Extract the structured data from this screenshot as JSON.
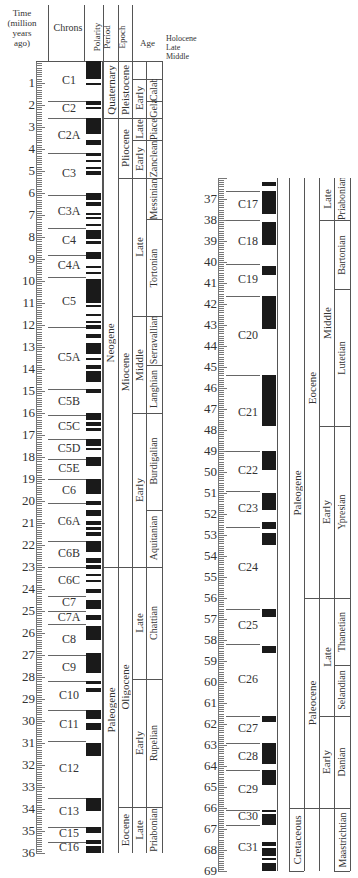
{
  "chart_data": {
    "type": "table",
    "headers": [
      "Time (million years ago)",
      "Chrons",
      "Polarity",
      "Period",
      "Epoch",
      "Age"
    ],
    "age_labels_top": [
      "Holocene",
      "Late",
      "Middle",
      "Calabrian",
      "Gelasian",
      "Piacenzian"
    ],
    "left_axis": {
      "range": [
        0,
        36
      ],
      "ticks": [
        1,
        2,
        3,
        4,
        5,
        6,
        7,
        8,
        9,
        10,
        11,
        12,
        13,
        14,
        15,
        16,
        17,
        18,
        19,
        20,
        21,
        22,
        23,
        24,
        25,
        26,
        27,
        28,
        29,
        30,
        31,
        32,
        33,
        34,
        35,
        36
      ]
    },
    "right_axis": {
      "range": [
        36,
        69
      ],
      "ticks": [
        37,
        38,
        39,
        40,
        41,
        42,
        43,
        44,
        45,
        46,
        47,
        48,
        49,
        50,
        51,
        52,
        53,
        54,
        55,
        56,
        57,
        58,
        59,
        60,
        61,
        62,
        63,
        64,
        65,
        66,
        67,
        68,
        69
      ]
    },
    "chrons": [
      {
        "name": "C1",
        "start": 0,
        "end": 1.8
      },
      {
        "name": "C2",
        "start": 1.8,
        "end": 2.6
      },
      {
        "name": "C2A",
        "start": 2.6,
        "end": 4.2
      },
      {
        "name": "C3",
        "start": 4.2,
        "end": 6.1
      },
      {
        "name": "C3A",
        "start": 6.1,
        "end": 7.6
      },
      {
        "name": "C4",
        "start": 7.6,
        "end": 8.8
      },
      {
        "name": "C4A",
        "start": 8.8,
        "end": 9.8
      },
      {
        "name": "C5",
        "start": 9.8,
        "end": 12.1
      },
      {
        "name": "C5A",
        "start": 12.1,
        "end": 14.9
      },
      {
        "name": "C5B",
        "start": 14.9,
        "end": 16.1
      },
      {
        "name": "C5C",
        "start": 16.1,
        "end": 17.2
      },
      {
        "name": "C5D",
        "start": 17.2,
        "end": 18.1
      },
      {
        "name": "C5E",
        "start": 18.1,
        "end": 19.0
      },
      {
        "name": "C6",
        "start": 19.0,
        "end": 20.1
      },
      {
        "name": "C6A",
        "start": 20.1,
        "end": 21.8
      },
      {
        "name": "C6B",
        "start": 21.8,
        "end": 23.0
      },
      {
        "name": "C6C",
        "start": 23.0,
        "end": 24.3
      },
      {
        "name": "C7",
        "start": 24.3,
        "end": 25.0
      },
      {
        "name": "C7A",
        "start": 25.0,
        "end": 25.6
      },
      {
        "name": "C8",
        "start": 25.6,
        "end": 27.0
      },
      {
        "name": "C9",
        "start": 27.0,
        "end": 28.2
      },
      {
        "name": "C10",
        "start": 28.2,
        "end": 29.5
      },
      {
        "name": "C11",
        "start": 29.5,
        "end": 30.9
      },
      {
        "name": "C12",
        "start": 30.9,
        "end": 33.5
      },
      {
        "name": "C13",
        "start": 33.5,
        "end": 34.8
      },
      {
        "name": "C15",
        "start": 34.8,
        "end": 35.5
      },
      {
        "name": "C16",
        "start": 35.5,
        "end": 36.6
      },
      {
        "name": "C17",
        "start": 36.6,
        "end": 38.0
      },
      {
        "name": "C18",
        "start": 38.0,
        "end": 40.1
      },
      {
        "name": "C19",
        "start": 40.1,
        "end": 41.6
      },
      {
        "name": "C20",
        "start": 41.6,
        "end": 45.4
      },
      {
        "name": "C21",
        "start": 45.4,
        "end": 49.0
      },
      {
        "name": "C22",
        "start": 49.0,
        "end": 50.9
      },
      {
        "name": "C23",
        "start": 50.9,
        "end": 52.6
      },
      {
        "name": "C24",
        "start": 52.6,
        "end": 56.5
      },
      {
        "name": "C25",
        "start": 56.5,
        "end": 58.2
      },
      {
        "name": "C26",
        "start": 58.2,
        "end": 61.6
      },
      {
        "name": "C27",
        "start": 61.6,
        "end": 62.9
      },
      {
        "name": "C28",
        "start": 62.9,
        "end": 64.2
      },
      {
        "name": "C29",
        "start": 64.2,
        "end": 66.1
      },
      {
        "name": "C30",
        "start": 66.1,
        "end": 66.8
      },
      {
        "name": "C31",
        "start": 66.8,
        "end": 69.0
      }
    ],
    "normal_polarity_intervals": [
      [
        0.0,
        0.8
      ],
      [
        1.0,
        1.1
      ],
      [
        1.8,
        2.0
      ],
      [
        2.1,
        2.2
      ],
      [
        2.6,
        3.3
      ],
      [
        3.6,
        3.8
      ],
      [
        4.2,
        4.3
      ],
      [
        4.5,
        4.6
      ],
      [
        4.8,
        4.9
      ],
      [
        5.0,
        5.2
      ],
      [
        6.0,
        6.3
      ],
      [
        6.4,
        6.6
      ],
      [
        6.9,
        7.0
      ],
      [
        7.1,
        7.2
      ],
      [
        7.4,
        7.5
      ],
      [
        7.7,
        8.1
      ],
      [
        8.2,
        8.3
      ],
      [
        8.7,
        9.0
      ],
      [
        9.3,
        9.4
      ],
      [
        9.6,
        9.7
      ],
      [
        9.9,
        11.0
      ],
      [
        11.1,
        11.2
      ],
      [
        11.5,
        11.6
      ],
      [
        11.8,
        11.9
      ],
      [
        12.0,
        12.2
      ],
      [
        12.4,
        12.6
      ],
      [
        12.8,
        13.3
      ],
      [
        13.5,
        13.6
      ],
      [
        13.8,
        14.0
      ],
      [
        14.1,
        14.6
      ],
      [
        14.9,
        15.1
      ],
      [
        16.0,
        16.3
      ],
      [
        16.4,
        16.6
      ],
      [
        16.7,
        16.8
      ],
      [
        17.2,
        17.5
      ],
      [
        17.6,
        17.7
      ],
      [
        18.0,
        18.4
      ],
      [
        19.0,
        19.7
      ],
      [
        20.0,
        20.2
      ],
      [
        20.4,
        20.7
      ],
      [
        20.9,
        21.1
      ],
      [
        21.2,
        21.3
      ],
      [
        21.4,
        21.6
      ],
      [
        21.8,
        22.3
      ],
      [
        22.6,
        22.8
      ],
      [
        22.9,
        23.1
      ],
      [
        23.3,
        23.4
      ],
      [
        23.6,
        23.7
      ],
      [
        24.0,
        24.2
      ],
      [
        24.5,
        24.9
      ],
      [
        25.2,
        25.4
      ],
      [
        25.7,
        26.3
      ],
      [
        26.9,
        27.8
      ],
      [
        28.2,
        28.3
      ],
      [
        28.5,
        28.7
      ],
      [
        29.5,
        29.9
      ],
      [
        30.1,
        30.4
      ],
      [
        31.0,
        31.6
      ],
      [
        33.5,
        34.1
      ],
      [
        34.8,
        35.1
      ],
      [
        35.4,
        35.6
      ],
      [
        35.7,
        36.0
      ],
      [
        36.2,
        36.4
      ],
      [
        36.6,
        37.7
      ],
      [
        38.1,
        39.2
      ],
      [
        40.2,
        40.6
      ],
      [
        41.6,
        43.2
      ],
      [
        45.4,
        47.8
      ],
      [
        49.0,
        49.9
      ],
      [
        51.0,
        51.8
      ],
      [
        52.4,
        52.7
      ],
      [
        52.9,
        53.5
      ],
      [
        56.5,
        56.9
      ],
      [
        58.3,
        58.6
      ],
      [
        61.6,
        61.9
      ],
      [
        62.9,
        63.9
      ],
      [
        64.2,
        64.9
      ],
      [
        66.1,
        66.2
      ],
      [
        66.3,
        66.8
      ],
      [
        67.6,
        67.8
      ],
      [
        67.9,
        68.3
      ],
      [
        68.4,
        68.5
      ],
      [
        68.6,
        69.0
      ]
    ],
    "periods": [
      {
        "name": "Quaternary",
        "start": 0,
        "end": 2.6
      },
      {
        "name": "Neogene",
        "start": 2.6,
        "end": 23.0
      },
      {
        "name": "Paleogene",
        "start": 23.0,
        "end": 66.0
      },
      {
        "name": "Cretaceous",
        "start": 66.0,
        "end": 69.0
      }
    ],
    "epochs": [
      {
        "name": "Pleistocene",
        "start": 0.01,
        "end": 2.6
      },
      {
        "name": "Pliocene",
        "start": 2.6,
        "end": 5.3
      },
      {
        "name": "Miocene",
        "start": 5.3,
        "end": 23.0
      },
      {
        "name": "Oligocene",
        "start": 23.0,
        "end": 33.9
      },
      {
        "name": "Eocene",
        "start": 33.9,
        "end": 56.0
      },
      {
        "name": "Paleocene",
        "start": 56.0,
        "end": 66.0
      }
    ],
    "subepochs": [
      {
        "name": "Early",
        "epoch": "Pleistocene",
        "start": 0.8,
        "end": 2.6
      },
      {
        "name": "Late",
        "epoch": "Pliocene",
        "start": 2.6,
        "end": 3.6
      },
      {
        "name": "Early",
        "epoch": "Pliocene",
        "start": 3.6,
        "end": 5.3
      },
      {
        "name": "Late",
        "epoch": "Miocene",
        "start": 5.3,
        "end": 11.6
      },
      {
        "name": "Middle",
        "epoch": "Miocene",
        "start": 11.6,
        "end": 16.0
      },
      {
        "name": "Early",
        "epoch": "Miocene",
        "start": 16.0,
        "end": 23.0
      },
      {
        "name": "Late",
        "epoch": "Oligocene",
        "start": 23.0,
        "end": 28.1
      },
      {
        "name": "Early",
        "epoch": "Oligocene",
        "start": 28.1,
        "end": 33.9
      },
      {
        "name": "Late",
        "epoch": "Eocene",
        "start": 33.9,
        "end": 38.0
      },
      {
        "name": "Middle",
        "epoch": "Eocene",
        "start": 38.0,
        "end": 47.8
      },
      {
        "name": "Early",
        "epoch": "Eocene",
        "start": 47.8,
        "end": 56.0
      },
      {
        "name": "Late",
        "epoch": "Paleocene",
        "start": 56.0,
        "end": 61.6
      },
      {
        "name": "Early",
        "epoch": "Paleocene",
        "start": 61.6,
        "end": 66.0
      }
    ],
    "ages": [
      {
        "name": "Calabrian",
        "start": 0.8,
        "end": 1.8
      },
      {
        "name": "Gelasian",
        "start": 1.8,
        "end": 2.6
      },
      {
        "name": "Piacenzian",
        "start": 2.6,
        "end": 3.6
      },
      {
        "name": "Zanclean",
        "start": 3.6,
        "end": 5.3
      },
      {
        "name": "Messinian",
        "start": 5.3,
        "end": 7.2
      },
      {
        "name": "Tortonian",
        "start": 7.2,
        "end": 11.6
      },
      {
        "name": "Serravallian",
        "start": 11.6,
        "end": 13.8
      },
      {
        "name": "Langhian",
        "start": 13.8,
        "end": 16.0
      },
      {
        "name": "Burdigalian",
        "start": 16.0,
        "end": 20.4
      },
      {
        "name": "Aquitanian",
        "start": 20.4,
        "end": 23.0
      },
      {
        "name": "Chattian",
        "start": 23.0,
        "end": 28.1
      },
      {
        "name": "Rupelian",
        "start": 28.1,
        "end": 33.9
      },
      {
        "name": "Priabonian",
        "start": 33.9,
        "end": 38.0
      },
      {
        "name": "Bartonian",
        "start": 38.0,
        "end": 41.3
      },
      {
        "name": "Lutetian",
        "start": 41.3,
        "end": 47.8
      },
      {
        "name": "Ypresian",
        "start": 47.8,
        "end": 56.0
      },
      {
        "name": "Thanetian",
        "start": 56.0,
        "end": 59.2
      },
      {
        "name": "Selandian",
        "start": 59.2,
        "end": 61.6
      },
      {
        "name": "Danian",
        "start": 61.6,
        "end": 66.0
      },
      {
        "name": "Maastrichtian",
        "start": 66.0,
        "end": 69.0
      }
    ]
  },
  "labels": {
    "header_time": "Time (million years ago)",
    "header_time_l1": "Time",
    "header_time_l2": "(million",
    "header_time_l3": "years",
    "header_time_l4": "ago)",
    "header_chrons": "Chrons",
    "header_polarity": "Polarity",
    "header_period": "Period",
    "header_epoch": "Epoch",
    "header_age": "Age",
    "holocene": "Holocene",
    "late": "Late",
    "middle": "Middle"
  }
}
